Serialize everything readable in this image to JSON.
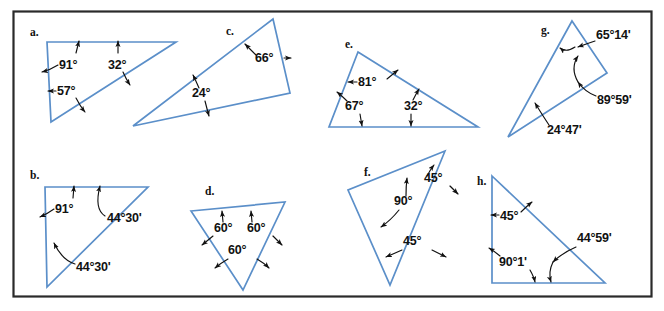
{
  "figure": {
    "frame_color": "#2a2a2a",
    "triangle_color": "#5b8fc9",
    "annotation_color": "#111111",
    "background": "#ffffff"
  },
  "panels": [
    {
      "id": "a",
      "label": "a.",
      "angles": [
        {
          "id": "a-91",
          "text": "91°"
        },
        {
          "id": "a-32",
          "text": "32°"
        },
        {
          "id": "a-57",
          "text": "57°"
        }
      ]
    },
    {
      "id": "b",
      "label": "b.",
      "angles": [
        {
          "id": "b-91",
          "text": "91°"
        },
        {
          "id": "b-4430-top",
          "text": "44°30'"
        },
        {
          "id": "b-4430-bottom",
          "text": "44°30'"
        }
      ]
    },
    {
      "id": "c",
      "label": "c.",
      "angles": [
        {
          "id": "c-66",
          "text": "66°"
        },
        {
          "id": "c-24",
          "text": "24°"
        }
      ]
    },
    {
      "id": "d",
      "label": "d.",
      "angles": [
        {
          "id": "d-60-left",
          "text": "60°"
        },
        {
          "id": "d-60-right",
          "text": "60°"
        },
        {
          "id": "d-60-bottom",
          "text": "60°"
        }
      ]
    },
    {
      "id": "e",
      "label": "e.",
      "angles": [
        {
          "id": "e-81",
          "text": "81°"
        },
        {
          "id": "e-67",
          "text": "67°"
        },
        {
          "id": "e-32",
          "text": "32°"
        }
      ]
    },
    {
      "id": "f",
      "label": "f.",
      "angles": [
        {
          "id": "f-45-top",
          "text": "45°"
        },
        {
          "id": "f-90",
          "text": "90°"
        },
        {
          "id": "f-45-bottom",
          "text": "45°"
        }
      ]
    },
    {
      "id": "g",
      "label": "g.",
      "angles": [
        {
          "id": "g-6514",
          "text": "65°14'"
        },
        {
          "id": "g-8959",
          "text": "89°59'"
        },
        {
          "id": "g-2447",
          "text": "24°47'"
        }
      ]
    },
    {
      "id": "h",
      "label": "h.",
      "angles": [
        {
          "id": "h-45",
          "text": "45°"
        },
        {
          "id": "h-9001",
          "text": "90°1'"
        },
        {
          "id": "h-4459",
          "text": "44°59'"
        }
      ]
    }
  ]
}
